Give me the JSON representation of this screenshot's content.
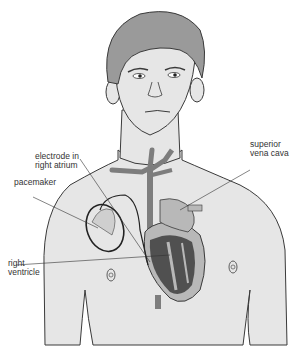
{
  "diagram": {
    "labels": {
      "electrode": [
        "electrode in",
        "right atrium"
      ],
      "svc": [
        "superior",
        "vena cava"
      ],
      "pacemaker": [
        "pacemaker"
      ],
      "rv": [
        "right",
        "ventricle"
      ]
    },
    "colors": {
      "skin": "#e6e6e6",
      "hair": "#9a9a9a",
      "outline": "#3a3a3a",
      "vessel": "#7d7d7d",
      "heart_light": "#b8b8b8",
      "heart_dark": "#505050"
    }
  }
}
